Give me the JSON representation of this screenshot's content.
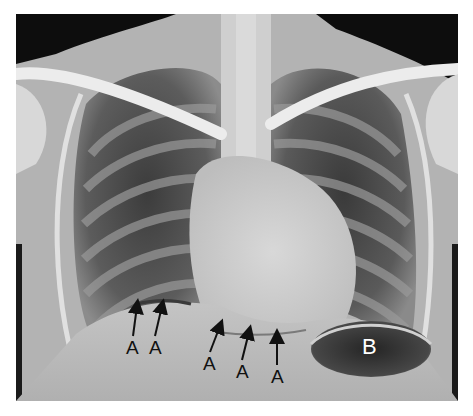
{
  "figure": {
    "type": "chest-radiograph",
    "view": "PA chest X-ray",
    "annotations": [
      {
        "id": "A1",
        "text": "A",
        "label_x": 126,
        "label_y": 338,
        "tip_x": 137,
        "tip_y": 303
      },
      {
        "id": "A2",
        "text": "A",
        "label_x": 149,
        "label_y": 338,
        "tip_x": 162,
        "tip_y": 303
      },
      {
        "id": "A3",
        "text": "A",
        "label_x": 203,
        "label_y": 354,
        "tip_x": 222,
        "tip_y": 324
      },
      {
        "id": "A4",
        "text": "A",
        "label_x": 236,
        "label_y": 362,
        "tip_x": 252,
        "tip_y": 331
      },
      {
        "id": "A5",
        "text": "A",
        "label_x": 271,
        "label_y": 367,
        "tip_x": 278,
        "tip_y": 336
      },
      {
        "id": "B",
        "text": "B",
        "label_x": 362,
        "label_y": 336
      }
    ],
    "colors": {
      "background": "#ffffff",
      "bone": "#e6e6e6",
      "soft_tissue": "#b5b5b5",
      "lung": "#4a4a4a",
      "air_outside": "#0a0a0a",
      "gastric_bubble": "#2e2e2e",
      "arrow": "#111111"
    }
  }
}
